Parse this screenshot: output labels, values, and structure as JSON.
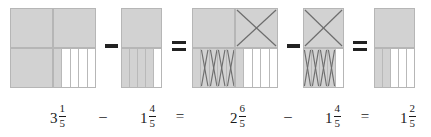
{
  "figure": {
    "fill_color": "#d2d2d2",
    "empty_color": "#ffffff",
    "border_color": "#b6b6b6",
    "x_mark_color": "#6d6d6d"
  },
  "expression": {
    "terms": [
      {
        "id": "minuend",
        "whole": "3",
        "numerator": "1",
        "denominator": "5"
      },
      {
        "id": "operator-1",
        "symbol": "–"
      },
      {
        "id": "subtrahend",
        "whole": "1",
        "numerator": "4",
        "denominator": "5"
      },
      {
        "id": "operator-2",
        "symbol": "="
      },
      {
        "id": "minuend-regrouped",
        "whole": "2",
        "numerator": "6",
        "denominator": "5"
      },
      {
        "id": "operator-3",
        "symbol": "–"
      },
      {
        "id": "subtrahend-2",
        "whole": "1",
        "numerator": "4",
        "denominator": "5"
      },
      {
        "id": "operator-4",
        "symbol": "="
      },
      {
        "id": "difference",
        "whole": "1",
        "numerator": "2",
        "denominator": "5"
      }
    ]
  },
  "diagrams": [
    {
      "id": "model-three-and-one-fifth",
      "label": "3 1/5",
      "wholes_shaded": 3,
      "fifths_shaded": 1,
      "fifths_total": 5,
      "crossed_out_wholes": 0,
      "crossed_out_fifths": 0
    },
    {
      "id": "model-one-and-four-fifths",
      "label": "1 4/5",
      "wholes_shaded": 1,
      "fifths_shaded": 4,
      "fifths_total": 5,
      "crossed_out_wholes": 0,
      "crossed_out_fifths": 0
    },
    {
      "id": "model-two-and-six-fifths",
      "label": "2 6/5",
      "wholes_shaded": 2,
      "fifths_shaded": 6,
      "fifths_total": 10,
      "crossed_out_wholes": 1,
      "crossed_out_fifths": 4
    },
    {
      "id": "model-one-and-four-fifths-removed",
      "label": "1 4/5",
      "wholes_shaded": 1,
      "fifths_shaded": 4,
      "fifths_total": 5,
      "crossed_out_wholes": 1,
      "crossed_out_fifths": 4
    },
    {
      "id": "model-one-and-two-fifths",
      "label": "1 2/5",
      "wholes_shaded": 1,
      "fifths_shaded": 2,
      "fifths_total": 5,
      "crossed_out_wholes": 0,
      "crossed_out_fifths": 0
    }
  ],
  "operators_between_diagrams": [
    {
      "id": "diagram-op-minus-1",
      "symbol": "minus"
    },
    {
      "id": "diagram-op-equals-1",
      "symbol": "equals"
    },
    {
      "id": "diagram-op-minus-2",
      "symbol": "minus"
    },
    {
      "id": "diagram-op-equals-2",
      "symbol": "equals"
    }
  ]
}
